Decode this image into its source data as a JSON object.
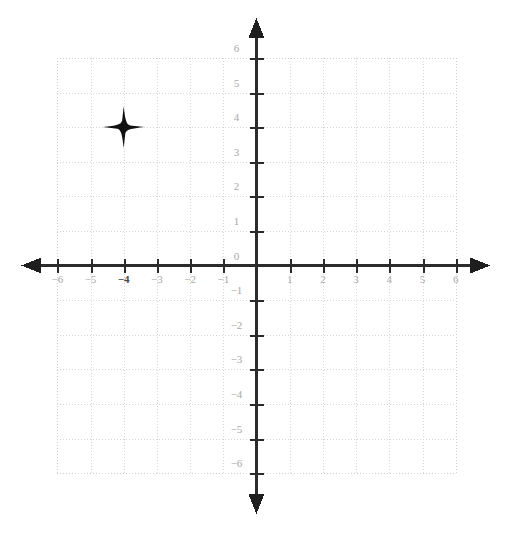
{
  "figure": {
    "kind": "coordinate-plane",
    "title": "",
    "background_color": "#ffffff",
    "grid_color": "#d9d9d9",
    "axis_color": "#2b2b2b",
    "label_color": "#a8a8a8",
    "marker_color": "#111111"
  },
  "chart_data": {
    "type": "scatter",
    "title": "",
    "xlabel": "",
    "ylabel": "",
    "xlim": [
      -6,
      6
    ],
    "ylim": [
      -6,
      6
    ],
    "grid": true,
    "legend": "none",
    "x_ticks": [
      -6,
      -5,
      -4,
      -3,
      -2,
      -1,
      0,
      1,
      2,
      3,
      4,
      5,
      6
    ],
    "y_ticks": [
      -6,
      -5,
      -4,
      -3,
      -2,
      -1,
      0,
      1,
      2,
      3,
      4,
      5,
      6
    ],
    "x_tick_labels": [
      "−6",
      "−5",
      "−4",
      "−3",
      "−2",
      "−1",
      "",
      "1",
      "2",
      "3",
      "4",
      "5",
      "6"
    ],
    "y_tick_labels": [
      "−6",
      "−5",
      "−4",
      "−3",
      "−2",
      "−1",
      "0",
      "1",
      "2",
      "3",
      "4",
      "5",
      "6"
    ],
    "origin_label": "0",
    "series": [
      {
        "name": "plotted point",
        "marker": "four-pointed-star",
        "points": [
          {
            "x": -4,
            "y": 4,
            "label": ""
          }
        ]
      }
    ]
  },
  "axes": {
    "x_axis_name": "x-axis",
    "y_axis_name": "y-axis",
    "arrowheads": [
      "left",
      "right",
      "up",
      "down"
    ]
  },
  "x_labels": [
    {
      "text": "−6",
      "value": -6,
      "emph": false
    },
    {
      "text": "−5",
      "value": -5,
      "emph": false
    },
    {
      "text": "−4",
      "value": -4,
      "emph": true
    },
    {
      "text": "−3",
      "value": -3,
      "emph": false
    },
    {
      "text": "−2",
      "value": -2,
      "emph": false
    },
    {
      "text": "−1",
      "value": -1,
      "emph": false
    },
    {
      "text": "1",
      "value": 1,
      "emph": false
    },
    {
      "text": "2",
      "value": 2,
      "emph": false
    },
    {
      "text": "3",
      "value": 3,
      "emph": false
    },
    {
      "text": "4",
      "value": 4,
      "emph": false
    },
    {
      "text": "5",
      "value": 5,
      "emph": false
    },
    {
      "text": "6",
      "value": 6,
      "emph": false
    }
  ],
  "y_labels": [
    {
      "text": "6",
      "value": 6,
      "emph": false
    },
    {
      "text": "5",
      "value": 5,
      "emph": false
    },
    {
      "text": "4",
      "value": 4,
      "emph": false
    },
    {
      "text": "3",
      "value": 3,
      "emph": false
    },
    {
      "text": "2",
      "value": 2,
      "emph": false
    },
    {
      "text": "1",
      "value": 1,
      "emph": false
    },
    {
      "text": "0",
      "value": 0,
      "emph": false
    },
    {
      "text": "−1",
      "value": -1,
      "emph": false
    },
    {
      "text": "−2",
      "value": -2,
      "emph": false
    },
    {
      "text": "−3",
      "value": -3,
      "emph": false
    },
    {
      "text": "−4",
      "value": -4,
      "emph": false
    },
    {
      "text": "−5",
      "value": -5,
      "emph": false
    },
    {
      "text": "−6",
      "value": -6,
      "emph": false
    }
  ]
}
